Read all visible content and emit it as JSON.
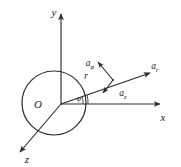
{
  "figure": {
    "kind": "cylindrical-coordinate-unit-vector-diagram",
    "title": "",
    "background_color": "#ffffff",
    "line_color": "#2b2b2b",
    "text_color": "#1a1a1a",
    "axes": [
      {
        "id": "y",
        "label": "y",
        "direction": "up",
        "label_x": 54,
        "label_y": 16
      },
      {
        "id": "x",
        "label": "x",
        "direction": "right",
        "label_x": 163,
        "label_y": 121
      },
      {
        "id": "z",
        "label": "z",
        "direction": "down-left",
        "label_x": 27,
        "label_y": 163
      }
    ],
    "origin": {
      "label": "O",
      "label_x": 38,
      "label_y": 108,
      "point_x": 61,
      "point_y": 104
    },
    "circle": {
      "center_x": 54,
      "center_y": 103,
      "radius": 32
    },
    "radial_line": {
      "label": "r",
      "label_x": 86,
      "label_y": 79
    },
    "angle": {
      "label": "φ",
      "label_x": 79,
      "label_y": 101
    },
    "vectors": [
      {
        "id": "a_phi",
        "base": "a",
        "subscript": "φ",
        "label_x": 90,
        "label_y": 66,
        "direction": "up-left-perpendicular"
      },
      {
        "id": "a_r",
        "base": "a",
        "subscript": "r",
        "label_x": 155,
        "label_y": 69,
        "direction": "outward-radial"
      },
      {
        "id": "a_z",
        "base": "a",
        "subscript": "z",
        "label_x": 123,
        "label_y": 96,
        "direction": "down-left-parallel-to-z"
      }
    ],
    "vector_point": {
      "x": 113,
      "y": 80
    }
  }
}
